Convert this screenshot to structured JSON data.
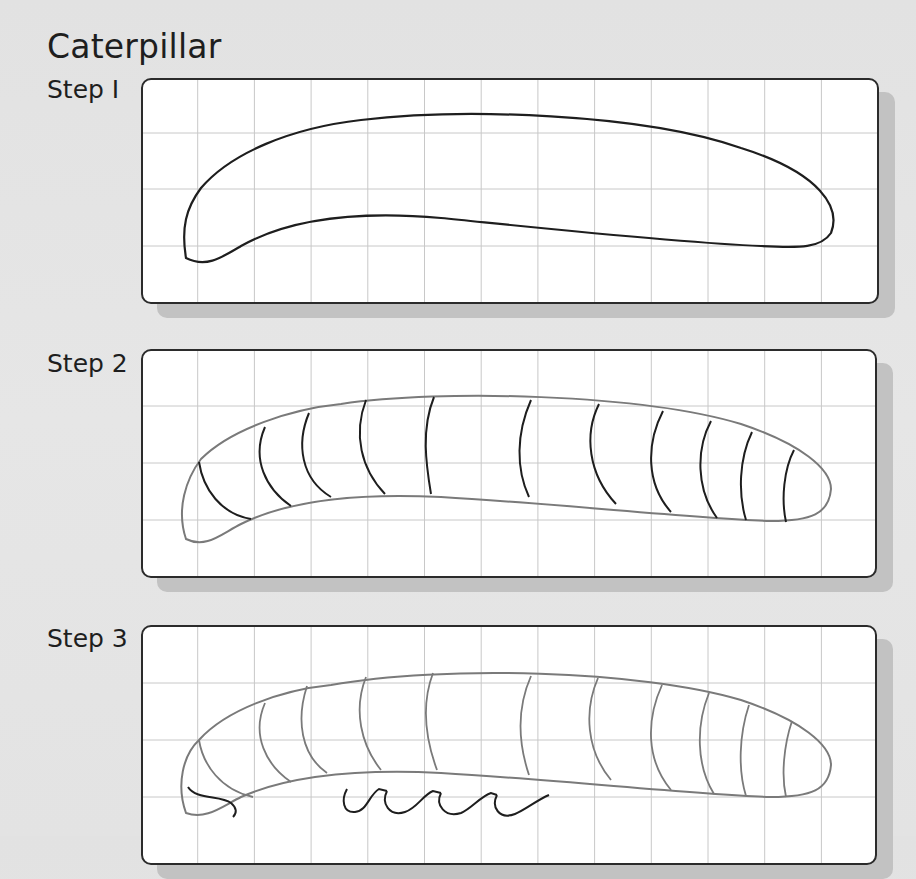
{
  "title": "Caterpillar",
  "steps": [
    {
      "label": "Step 1",
      "display": "Step I",
      "description": "Body outline"
    },
    {
      "label": "Step 2",
      "display": "Step 2",
      "description": "Body segments"
    },
    {
      "label": "Step 3",
      "display": "Step 3",
      "description": "Legs under body"
    }
  ],
  "colors": {
    "background": "#e4e4e4",
    "panel": "#ffffff",
    "panel_border": "#2b2b2b",
    "shadow": "#c2c2c2",
    "grid": "#c8c8c8",
    "ink_new": "#1e1e1e",
    "ink_previous": "#7a7a7a"
  },
  "grid": {
    "columns": 13,
    "rows": 4,
    "cell_px": 56.7
  }
}
